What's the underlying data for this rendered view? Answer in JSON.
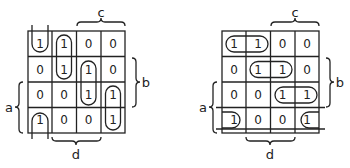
{
  "maps": [
    {
      "id": "left",
      "cells": [
        [
          "1",
          "1",
          "0",
          "0"
        ],
        [
          "0",
          "1",
          "1",
          "0"
        ],
        [
          "0",
          "0",
          "1",
          "1"
        ],
        [
          "1",
          "0",
          "0",
          "1"
        ]
      ],
      "labels": {
        "c": "c",
        "b": "b",
        "a": "a",
        "d": "d"
      },
      "groups": [
        "col0 row0 + row3 wrap (vertical)",
        "col1 rows0-1",
        "col2 rows1-2",
        "col3 rows2-3"
      ]
    },
    {
      "id": "right",
      "cells": [
        [
          "1",
          "1",
          "0",
          "0"
        ],
        [
          "0",
          "1",
          "1",
          "0"
        ],
        [
          "0",
          "0",
          "1",
          "1"
        ],
        [
          "1",
          "0",
          "0",
          "1"
        ]
      ],
      "labels": {
        "c": "c",
        "b": "b",
        "a": "a",
        "d": "d"
      },
      "groups": [
        "row0 cols0-1",
        "row1 cols1-2",
        "row2 cols2-3",
        "row3 col0 + col3 wrap (horizontal)"
      ]
    }
  ]
}
